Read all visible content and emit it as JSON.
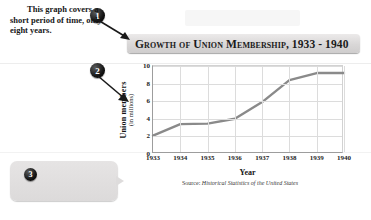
{
  "title": {
    "text": "Growth of Union Membership, 1933 - 1940"
  },
  "callouts": [
    {
      "number": "1",
      "target": "chart-title"
    },
    {
      "number": "2",
      "target": "y-axis-label"
    },
    {
      "number": "3",
      "text": "This graph covers a short period of time, only eight years."
    }
  ],
  "chart_data": {
    "type": "line",
    "title": "Growth of Union Membership, 1933 - 1940",
    "xlabel": "Year",
    "ylabel": "Union members",
    "ylabel_sub": "(in millions)",
    "categories": [
      "1933",
      "1934",
      "1935",
      "1936",
      "1937",
      "1938",
      "1939",
      "1940"
    ],
    "values": [
      2.1,
      3.4,
      3.45,
      4.0,
      5.9,
      8.4,
      9.2,
      9.2
    ],
    "ylim": [
      0,
      10
    ],
    "yticks": [
      "0",
      "2",
      "4",
      "6",
      "8",
      "10"
    ],
    "ytick_values": [
      0,
      2,
      4,
      6,
      8,
      10
    ],
    "grid": true,
    "legend": "none",
    "line_color": "#8a8a8a",
    "source": "Source: Historical Statistics of the United States",
    "source_prefix": "Source: ",
    "source_italic": "Historical Statistics of the United States"
  },
  "colors": {
    "line": "#8a8a8a",
    "grid": "#dcdcdc",
    "axis": "#9d9d9d",
    "title_bar": "#d9d7d7",
    "callout_bg": "#dedcdc",
    "badge": "#000000"
  }
}
